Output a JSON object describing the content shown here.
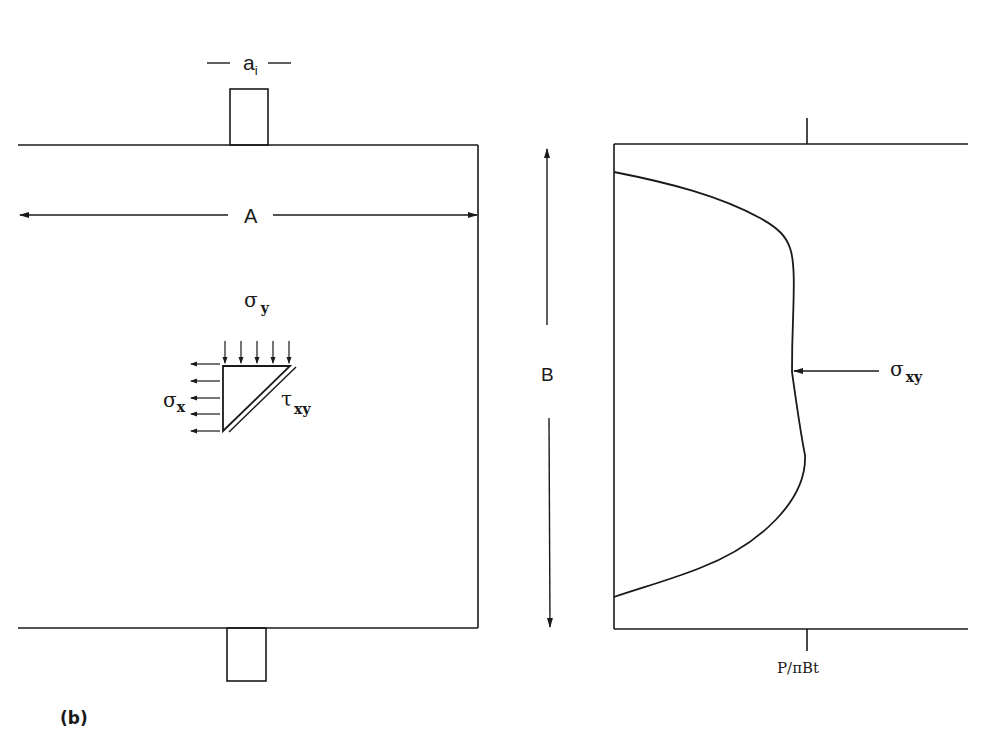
{
  "figure": {
    "panel_label": "(b)",
    "colors": {
      "ink": "#1a1a1a",
      "background": "#ffffff"
    }
  },
  "left_panel": {
    "loading_width_label": "a",
    "loading_width_subscript": "i",
    "width_label": "A",
    "stress_element": {
      "sigma_y_symbol": "σ",
      "sigma_y_subscript": "y",
      "sigma_x_symbol": "σ",
      "sigma_x_subscript": "x",
      "tau_xy_symbol": "τ",
      "tau_xy_subscript": "xy"
    }
  },
  "height_label": "B",
  "right_panel": {
    "curve_label_symbol": "σ",
    "curve_label_subscript": "xy",
    "load_label": "P/πBt"
  }
}
